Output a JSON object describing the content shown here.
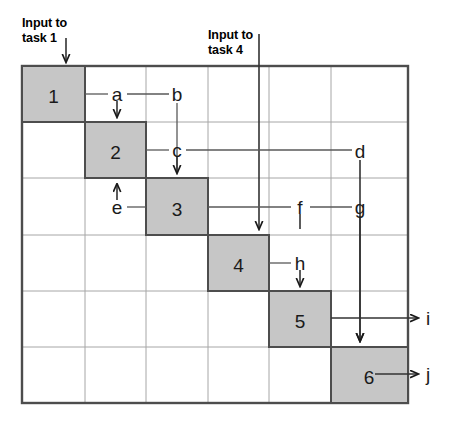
{
  "diagram": {
    "title_labels": [
      {
        "name": "input-to-task-1",
        "text": "Input to\ntask 1",
        "x": 22,
        "y": 16
      },
      {
        "name": "input-to-task-4",
        "text": "Input to\ntask 4",
        "x": 208,
        "y": 28
      }
    ],
    "grid": {
      "left": 22,
      "top": 66,
      "right": 408,
      "bottom": 403,
      "rows": 6,
      "cols": 6,
      "col_edges": [
        22,
        85,
        146,
        208,
        269,
        331,
        408
      ],
      "row_edges": [
        66,
        122,
        178,
        235,
        291,
        347,
        403
      ],
      "border_color": "#4d4d4d",
      "inner_line_color": "#999999",
      "cell_fill": "#ffffff"
    },
    "diagonal_cells": [
      {
        "label": "1",
        "row": 0,
        "col": 0
      },
      {
        "label": "2",
        "row": 1,
        "col": 1
      },
      {
        "label": "3",
        "row": 2,
        "col": 2
      },
      {
        "label": "4",
        "row": 3,
        "col": 3
      },
      {
        "label": "5",
        "row": 4,
        "col": 4
      },
      {
        "label": "6",
        "row": 5,
        "col": 5
      }
    ],
    "diagonal_fill": "#c6c6c6",
    "diagonal_stroke": "#4d4d4d",
    "flow_labels": [
      {
        "id": "a",
        "text": "a",
        "x": 117,
        "y": 97
      },
      {
        "id": "b",
        "text": "b",
        "x": 177,
        "y": 97
      },
      {
        "id": "c",
        "text": "c",
        "x": 177,
        "y": 153
      },
      {
        "id": "d",
        "text": "d",
        "x": 360,
        "y": 153
      },
      {
        "id": "e",
        "text": "e",
        "x": 117,
        "y": 212
      },
      {
        "id": "f",
        "text": "f",
        "x": 300,
        "y": 209
      },
      {
        "id": "g",
        "text": "g",
        "x": 360,
        "y": 209
      },
      {
        "id": "h",
        "text": "h",
        "x": 300,
        "y": 266
      },
      {
        "id": "i",
        "text": "i",
        "x": 428,
        "y": 320
      },
      {
        "id": "j",
        "text": "j",
        "x": 428,
        "y": 376
      }
    ],
    "output_arrows": [
      {
        "id": "i",
        "from_x": 390,
        "to_x": 418,
        "y": 318
      },
      {
        "id": "j",
        "from_x": 375,
        "to_x": 418,
        "y": 374
      }
    ],
    "line_color": "#595959"
  }
}
